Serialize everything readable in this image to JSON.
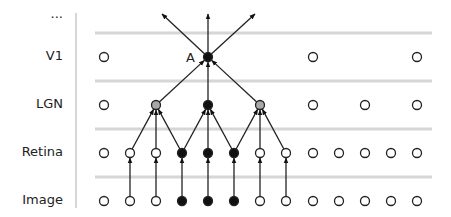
{
  "diagram": {
    "type": "layered-feedforward-network",
    "layers": [
      {
        "id": "top",
        "label": "...",
        "y": 16
      },
      {
        "id": "v1",
        "label": "V1",
        "y": 57
      },
      {
        "id": "lgn",
        "label": "LGN",
        "y": 105
      },
      {
        "id": "retina",
        "label": "Retina",
        "y": 153
      },
      {
        "id": "image",
        "label": "Image",
        "y": 201
      }
    ],
    "separators_y": [
      33,
      81,
      129,
      177
    ],
    "node_annotation": {
      "label": "A",
      "x": 186,
      "y": 62
    },
    "colors": {
      "active": "#111111",
      "partial": "#a8a8a8",
      "inactive": "#ffffff",
      "stroke": "#222222",
      "separator": "#d6d6d6"
    },
    "nodes": {
      "v1": [
        {
          "x": 104,
          "state": "inactive"
        },
        {
          "x": 208,
          "state": "active",
          "name": "A"
        },
        {
          "x": 313,
          "state": "inactive"
        },
        {
          "x": 417,
          "state": "inactive"
        }
      ],
      "lgn": [
        {
          "x": 104,
          "state": "inactive"
        },
        {
          "x": 156,
          "state": "partial"
        },
        {
          "x": 208,
          "state": "active"
        },
        {
          "x": 260,
          "state": "partial"
        },
        {
          "x": 313,
          "state": "inactive"
        },
        {
          "x": 365,
          "state": "inactive"
        },
        {
          "x": 417,
          "state": "inactive"
        }
      ],
      "retina": [
        {
          "x": 104,
          "state": "inactive"
        },
        {
          "x": 130,
          "state": "inactive"
        },
        {
          "x": 156,
          "state": "inactive"
        },
        {
          "x": 182,
          "state": "active"
        },
        {
          "x": 208,
          "state": "active"
        },
        {
          "x": 234,
          "state": "active"
        },
        {
          "x": 260,
          "state": "inactive"
        },
        {
          "x": 286,
          "state": "inactive"
        },
        {
          "x": 313,
          "state": "inactive"
        },
        {
          "x": 339,
          "state": "inactive"
        },
        {
          "x": 365,
          "state": "inactive"
        },
        {
          "x": 391,
          "state": "inactive"
        },
        {
          "x": 417,
          "state": "inactive"
        }
      ],
      "image": [
        {
          "x": 104,
          "state": "inactive"
        },
        {
          "x": 130,
          "state": "inactive"
        },
        {
          "x": 156,
          "state": "inactive"
        },
        {
          "x": 182,
          "state": "active"
        },
        {
          "x": 208,
          "state": "active"
        },
        {
          "x": 234,
          "state": "active"
        },
        {
          "x": 260,
          "state": "inactive"
        },
        {
          "x": 286,
          "state": "inactive"
        },
        {
          "x": 313,
          "state": "inactive"
        },
        {
          "x": 339,
          "state": "inactive"
        },
        {
          "x": 365,
          "state": "inactive"
        },
        {
          "x": 391,
          "state": "inactive"
        },
        {
          "x": 417,
          "state": "inactive"
        }
      ]
    },
    "edges": [
      {
        "from": [
          130,
          201
        ],
        "to": [
          130,
          153
        ]
      },
      {
        "from": [
          156,
          201
        ],
        "to": [
          156,
          153
        ]
      },
      {
        "from": [
          182,
          201
        ],
        "to": [
          182,
          153
        ]
      },
      {
        "from": [
          208,
          201
        ],
        "to": [
          208,
          153
        ]
      },
      {
        "from": [
          234,
          201
        ],
        "to": [
          234,
          153
        ]
      },
      {
        "from": [
          260,
          201
        ],
        "to": [
          260,
          153
        ]
      },
      {
        "from": [
          286,
          201
        ],
        "to": [
          286,
          153
        ]
      },
      {
        "from": [
          130,
          153
        ],
        "to": [
          156,
          105
        ]
      },
      {
        "from": [
          156,
          153
        ],
        "to": [
          156,
          105
        ]
      },
      {
        "from": [
          182,
          153
        ],
        "to": [
          156,
          105
        ]
      },
      {
        "from": [
          182,
          153
        ],
        "to": [
          208,
          105
        ]
      },
      {
        "from": [
          208,
          153
        ],
        "to": [
          208,
          105
        ]
      },
      {
        "from": [
          234,
          153
        ],
        "to": [
          208,
          105
        ]
      },
      {
        "from": [
          234,
          153
        ],
        "to": [
          260,
          105
        ]
      },
      {
        "from": [
          260,
          153
        ],
        "to": [
          260,
          105
        ]
      },
      {
        "from": [
          286,
          153
        ],
        "to": [
          260,
          105
        ]
      },
      {
        "from": [
          156,
          105
        ],
        "to": [
          208,
          57
        ]
      },
      {
        "from": [
          208,
          105
        ],
        "to": [
          208,
          57
        ]
      },
      {
        "from": [
          260,
          105
        ],
        "to": [
          208,
          57
        ]
      },
      {
        "from": [
          208,
          57
        ],
        "to": [
          162,
          14
        ]
      },
      {
        "from": [
          208,
          57
        ],
        "to": [
          208,
          14
        ]
      },
      {
        "from": [
          208,
          57
        ],
        "to": [
          255,
          14
        ]
      }
    ],
    "axis_line": {
      "x": 76,
      "y1": 13,
      "y2": 208
    },
    "separator_x_range": [
      95,
      432
    ]
  }
}
